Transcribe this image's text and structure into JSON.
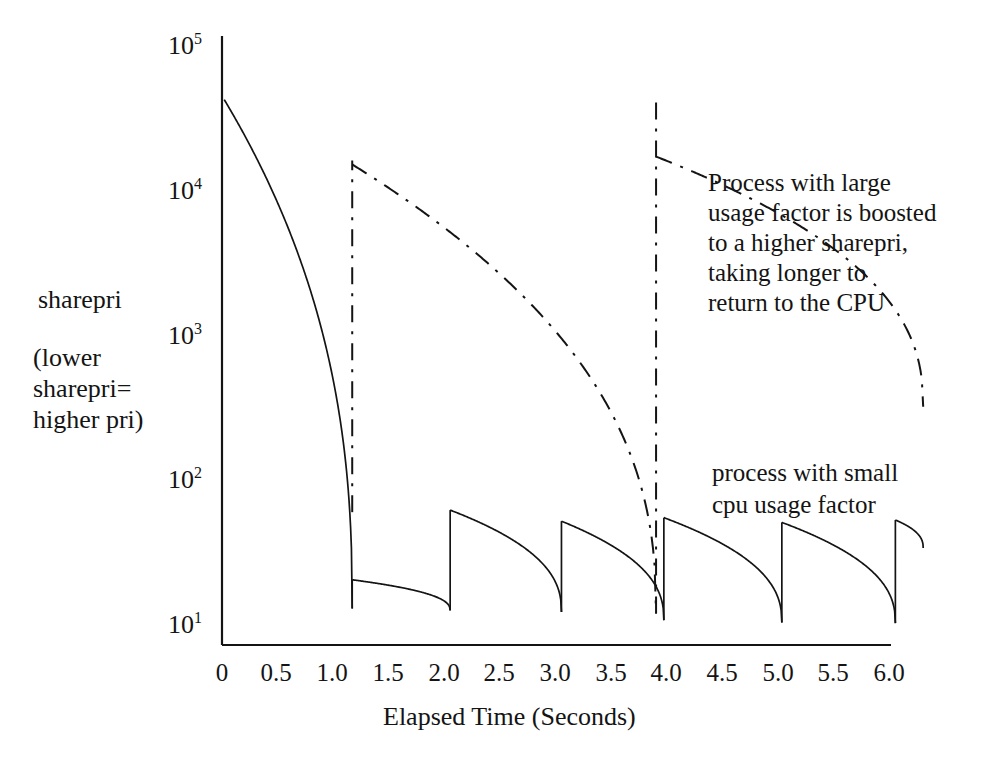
{
  "figure": {
    "background": "#ffffff",
    "ink": "#141414"
  },
  "axis": {
    "y_label_main": "sharepri",
    "y_label_sub_line1": "(lower",
    "y_label_sub_line2": "sharepri=",
    "y_label_sub_line3": "higher pri)",
    "x_title": "Elapsed Time (Seconds)",
    "y_ticks": [
      {
        "base": "10",
        "exp": "5",
        "value": 100000
      },
      {
        "base": "10",
        "exp": "4",
        "value": 10000
      },
      {
        "base": "10",
        "exp": "3",
        "value": 1000
      },
      {
        "base": "10",
        "exp": "2",
        "value": 100
      },
      {
        "base": "10",
        "exp": "1",
        "value": 10
      }
    ],
    "x_ticks": [
      "0",
      "0.5",
      "1.0",
      "1.5",
      "2.0",
      "2.5",
      "3.0",
      "3.5",
      "4.0",
      "4.5",
      "5.0",
      "5.5",
      "6.0"
    ]
  },
  "annotations": {
    "large_usage": {
      "line1": "Process with large",
      "line2": "usage factor is boosted",
      "line3": "to a higher sharepri,",
      "line4": "taking longer to",
      "line5": "return to the CPU"
    },
    "small_usage": {
      "line1": "process with small",
      "line2": "cpu usage factor"
    }
  },
  "chart_data": {
    "type": "line",
    "title": "",
    "xlabel": "Elapsed Time (Seconds)",
    "ylabel": "sharepri",
    "yscale": "log",
    "xlim": [
      0,
      6.35
    ],
    "ylim": [
      8.5,
      100000
    ],
    "grid": false,
    "legend": "none (inline annotations)",
    "series": [
      {
        "name": "process with small cpu usage factor",
        "style": "solid",
        "color": "#141414",
        "description": "Sawtooth: exponential decay of sharepri then a jump up each time the process gets the CPU",
        "segments": [
          {
            "t_start": 0.02,
            "t_end": 1.17,
            "y_start": 42000,
            "y_end": 13.0
          },
          {
            "t_start": 1.17,
            "t_end": 2.05,
            "y_start": 20.5,
            "y_end": 12.6
          },
          {
            "t_start": 2.05,
            "t_end": 3.05,
            "y_start": 62.0,
            "y_end": 12.3
          },
          {
            "t_start": 3.05,
            "t_end": 3.97,
            "y_start": 52.0,
            "y_end": 10.8
          },
          {
            "t_start": 3.97,
            "t_end": 5.03,
            "y_start": 55.0,
            "y_end": 10.4
          },
          {
            "t_start": 5.03,
            "t_end": 6.05,
            "y_start": 51.0,
            "y_end": 10.3
          },
          {
            "t_start": 6.05,
            "t_end": 6.3,
            "y_start": 53.0,
            "y_end": 34.0
          }
        ],
        "jumps": [
          {
            "t": 1.17,
            "from": 13.0,
            "to": 20.5
          },
          {
            "t": 2.05,
            "from": 12.6,
            "to": 62.0
          },
          {
            "t": 3.05,
            "from": 12.3,
            "to": 52.0
          },
          {
            "t": 3.97,
            "from": 10.8,
            "to": 55.0
          },
          {
            "t": 5.03,
            "from": 10.4,
            "to": 51.0
          },
          {
            "t": 6.05,
            "from": 10.3,
            "to": 53.0
          }
        ]
      },
      {
        "name": "process with large usage factor",
        "style": "dash-dot",
        "color": "#141414",
        "description": "Boosted to much higher sharepri, decays slowly, takes far longer to return to the CPU",
        "segments": [
          {
            "t_start": 1.17,
            "t_end": 3.9,
            "y_start": 15000,
            "y_end": 12.0
          },
          {
            "t_start": 3.9,
            "t_end": 6.3,
            "y_start": 17000,
            "y_end": 320.0
          }
        ],
        "jumps": [
          {
            "t": 1.17,
            "from": 60.0,
            "to": 15000
          },
          {
            "t": 3.9,
            "from": 12.0,
            "to": 40000
          }
        ],
        "vertical_risers": [
          {
            "t": 1.17,
            "y_bottom": 60.0,
            "y_top": 16000
          },
          {
            "t": 3.9,
            "y_bottom": 12.0,
            "y_top": 45000
          }
        ]
      }
    ]
  }
}
